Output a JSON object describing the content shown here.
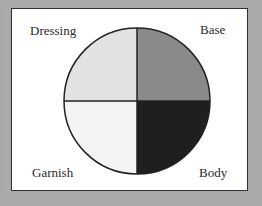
{
  "diagram": {
    "type": "quadrant-circle",
    "quadrants": [
      {
        "label": "Dressing",
        "position": "top-left",
        "color": "#e2e2e2"
      },
      {
        "label": "Base",
        "position": "top-right",
        "color": "#8a8a8a"
      },
      {
        "label": "Garnish",
        "position": "bottom-left",
        "color": "#f4f4f4"
      },
      {
        "label": "Body",
        "position": "bottom-right",
        "color": "#1f1f1f"
      }
    ]
  }
}
